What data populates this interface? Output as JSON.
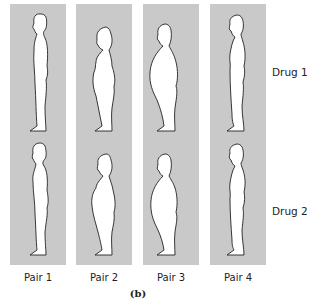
{
  "figure": {
    "caption": "(b)",
    "pairs": [
      {
        "label": "Pair 1",
        "drug1": "thin-male",
        "drug2": "thin-male"
      },
      {
        "label": "Pair 2",
        "drug1": "heavy-female",
        "drug2": "heavy-female"
      },
      {
        "label": "Pair 3",
        "drug1": "heavy-male",
        "drug2": "heavy-male"
      },
      {
        "label": "Pair 4",
        "drug1": "slim-female",
        "drug2": "slim-female"
      }
    ],
    "rows": [
      {
        "label": "Drug 1"
      },
      {
        "label": "Drug 2"
      }
    ],
    "colors": {
      "panel": "#c9c9c9",
      "silhouette_fill": "#ffffff",
      "outline": "#222222"
    }
  }
}
